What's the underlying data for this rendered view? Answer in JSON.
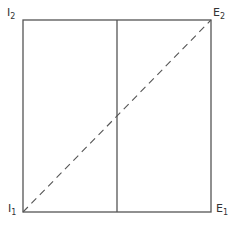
{
  "diagram": {
    "type": "edgeworth-box",
    "colors": {
      "line": "#555555",
      "background": "#ffffff"
    },
    "corners": {
      "top_left": {
        "letter": "I",
        "subscript": "2"
      },
      "top_right": {
        "letter": "E",
        "subscript": "2"
      },
      "bottom_left": {
        "letter": "I",
        "subscript": "1"
      },
      "bottom_right": {
        "letter": "E",
        "subscript": "1"
      }
    },
    "box": {
      "left": 23,
      "top": 20,
      "right": 211,
      "bottom": 212
    },
    "vertical_divider_x": 117,
    "diagonal": {
      "style": "dashed",
      "from": "bottom_left",
      "to": "top_right"
    }
  }
}
